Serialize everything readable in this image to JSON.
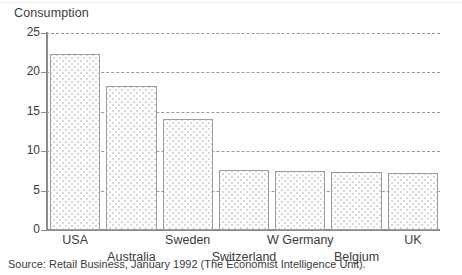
{
  "figure": {
    "y_axis_title": "Consumption",
    "source_note": "Source: Retail Business, January 1992 (The Economist Intelligence Unit)."
  },
  "chart_data": {
    "type": "bar",
    "title": "",
    "subtitle": "",
    "xlabel": "",
    "ylabel": "Consumption",
    "categories": [
      "USA",
      "Australia",
      "Sweden",
      "Switzerland",
      "W Germany",
      "Belgium",
      "UK"
    ],
    "values": [
      22.4,
      18.3,
      14.1,
      7.6,
      7.5,
      7.4,
      7.2
    ],
    "ylim": [
      0,
      25
    ],
    "yticks": [
      0,
      5,
      10,
      15,
      20,
      25
    ],
    "ytick_labels": [
      "0",
      "5",
      "10",
      "15",
      "20",
      "25"
    ],
    "grid": "horizontal-dashed",
    "legend": "none",
    "bar_fill": "#ffffff",
    "bar_fill_pattern": "fine-gray-dots",
    "bar_edge_color": "#9d9d9d",
    "gridline_color": "#9a9a9a",
    "axis_color": "#8c8c8c",
    "text_color": "#3b3b3b",
    "background": "#ffffff"
  }
}
